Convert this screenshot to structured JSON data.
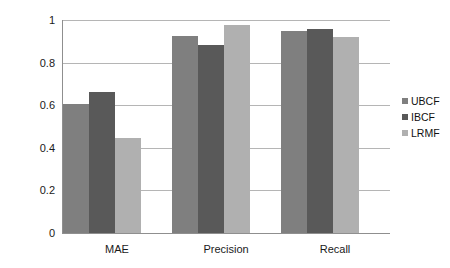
{
  "chart_data": {
    "type": "bar",
    "title": "",
    "subtitle": "",
    "xlabel": "",
    "ylabel": "",
    "categories": [
      "MAE",
      "Precision",
      "Recall"
    ],
    "series": [
      {
        "name": "UBCF",
        "color": "#7f7f7f",
        "values": [
          0.605,
          0.925,
          0.95
        ]
      },
      {
        "name": "IBCF",
        "color": "#595959",
        "values": [
          0.66,
          0.885,
          0.96
        ]
      },
      {
        "name": "LRMF",
        "color": "#b0b0b0",
        "values": [
          0.445,
          0.975,
          0.92
        ]
      }
    ],
    "ylim": [
      0,
      1
    ],
    "yticks": [
      0,
      0.2,
      0.4,
      0.6,
      0.8,
      1
    ],
    "ytick_labels": [
      "0",
      "0.2",
      "0.4",
      "0.6",
      "0.8",
      "1"
    ],
    "grid": true,
    "legend_position": "right",
    "axis_color": "#8f8f8f",
    "gridline_color": "#b5b5b5",
    "background": "#ffffff"
  }
}
